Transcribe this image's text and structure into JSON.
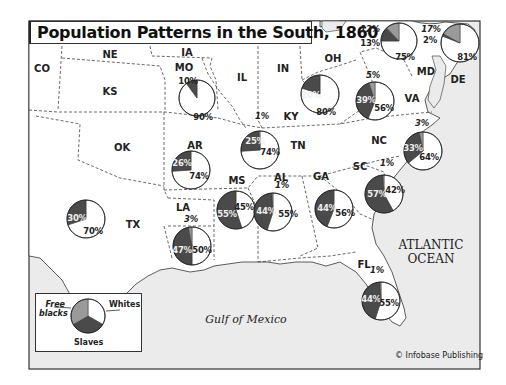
{
  "title": "Population Patterns in the South, 1860",
  "credit": "© Infobase Publishing",
  "water_labels": {
    "atlantic_line1": "ATLANTIC",
    "atlantic_line2": "OCEAN",
    "gulf": "Gulf of Mexico"
  },
  "neighbor_states": {
    "CO": "CO",
    "NE": "NE",
    "IA": "IA",
    "KS": "KS",
    "IL": "IL",
    "IN": "IN",
    "OH": "OH",
    "OK": "OK"
  },
  "legend": {
    "free_blacks": "Free blacks",
    "free_blacks_line1": "Free",
    "free_blacks_line2": "blacks",
    "whites": "Whites",
    "slaves": "Slaves"
  },
  "colors": {
    "whites": "#ffffff",
    "slaves": "#4a4a4a",
    "free_blacks": "#9a9a9a",
    "land": "#ffffff",
    "water": "#ebebeb",
    "border": "#555555"
  },
  "chart_data": {
    "type": "pie",
    "title": "Population Patterns in the South, 1860",
    "legend": [
      "Whites",
      "Slaves",
      "Free blacks"
    ],
    "states": [
      {
        "state": "MO",
        "whites": 90,
        "slaves": 10,
        "free_blacks": 0
      },
      {
        "state": "KY",
        "whites": 80,
        "slaves": 20,
        "free_blacks": 0
      },
      {
        "state": "MD",
        "whites": 75,
        "slaves": 13,
        "free_blacks": 12
      },
      {
        "state": "DE",
        "whites": 81,
        "slaves": 2,
        "free_blacks": 17
      },
      {
        "state": "VA",
        "whites": 56,
        "slaves": 39,
        "free_blacks": 5
      },
      {
        "state": "TN",
        "whites": 74,
        "slaves": 25,
        "free_blacks": 1
      },
      {
        "state": "AR",
        "whites": 74,
        "slaves": 26,
        "free_blacks": 0
      },
      {
        "state": "NC",
        "whites": 64,
        "slaves": 33,
        "free_blacks": 3
      },
      {
        "state": "SC",
        "whites": 42,
        "slaves": 57,
        "free_blacks": 1
      },
      {
        "state": "MS",
        "whites": 45,
        "slaves": 55,
        "free_blacks": 0
      },
      {
        "state": "AL",
        "whites": 55,
        "slaves": 44,
        "free_blacks": 1
      },
      {
        "state": "GA",
        "whites": 56,
        "slaves": 44,
        "free_blacks": 0
      },
      {
        "state": "LA",
        "whites": 50,
        "slaves": 47,
        "free_blacks": 3
      },
      {
        "state": "TX",
        "whites": 70,
        "slaves": 30,
        "free_blacks": 0
      },
      {
        "state": "FL",
        "whites": 55,
        "slaves": 44,
        "free_blacks": 1
      }
    ]
  },
  "pie_labels": {
    "MO": {
      "state": "MO",
      "whites": "90%",
      "slaves": "10%"
    },
    "KY": {
      "state": "KY",
      "whites": "80%",
      "slaves": "20%",
      "free": "1%"
    },
    "MD": {
      "state": "MD",
      "whites": "75%",
      "slaves": "13%",
      "free": "12%"
    },
    "DE": {
      "state": "DE",
      "whites": "81%",
      "slaves": "2%",
      "free": "17%"
    },
    "VA": {
      "state": "VA",
      "whites": "56%",
      "slaves": "39%",
      "free": "5%"
    },
    "TN": {
      "state": "TN",
      "whites": "74%",
      "slaves": "25%",
      "free": "1%"
    },
    "AR": {
      "state": "AR",
      "whites": "74%",
      "slaves": "26%"
    },
    "NC": {
      "state": "NC",
      "whites": "64%",
      "slaves": "33%",
      "free": "3%"
    },
    "SC": {
      "state": "SC",
      "whites": "42%",
      "slaves": "57%",
      "free": "1%"
    },
    "MS": {
      "state": "MS",
      "whites": "45%",
      "slaves": "55%"
    },
    "AL": {
      "state": "AL",
      "whites": "55%",
      "slaves": "44%",
      "free": "1%"
    },
    "GA": {
      "state": "GA",
      "whites": "56%",
      "slaves": "44%"
    },
    "LA": {
      "state": "LA",
      "whites": "50%",
      "slaves": "47%",
      "free": "3%"
    },
    "TX": {
      "state": "TX",
      "whites": "70%",
      "slaves": "30%"
    },
    "FL": {
      "state": "FL",
      "whites": "55%",
      "slaves": "44%",
      "free": "1%"
    }
  }
}
